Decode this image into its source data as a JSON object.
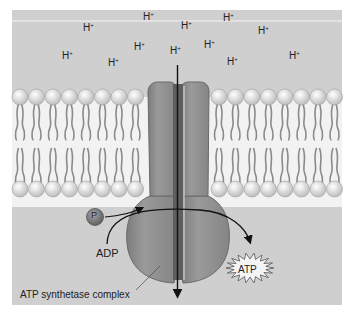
{
  "colors": {
    "panel": "#cfcfcf",
    "membrane_core": "#f2f2f2",
    "lipid_head": "#e4e4e4",
    "lipid_tail": "#8a8a8a",
    "protein": "#8c8c8c",
    "protein_dark": "#5e5e5e",
    "phosphate": "#7a7a7a",
    "arrow": "#111111"
  },
  "protons": [
    {
      "label": "H",
      "charge": "+",
      "x": 143,
      "y": 19
    },
    {
      "label": "H",
      "charge": "+",
      "x": 223,
      "y": 20
    },
    {
      "label": "H",
      "charge": "+",
      "x": 83,
      "y": 30
    },
    {
      "label": "H",
      "charge": "+",
      "x": 181,
      "y": 28
    },
    {
      "label": "H",
      "charge": "+",
      "x": 258,
      "y": 33
    },
    {
      "label": "H",
      "charge": "+",
      "x": 134,
      "y": 49
    },
    {
      "label": "H",
      "charge": "+",
      "x": 204,
      "y": 47
    },
    {
      "label": "H",
      "charge": "+",
      "x": 62,
      "y": 58
    },
    {
      "label": "H",
      "charge": "+",
      "x": 170,
      "y": 53
    },
    {
      "label": "H",
      "charge": "+",
      "x": 108,
      "y": 65
    },
    {
      "label": "H",
      "charge": "+",
      "x": 227,
      "y": 64
    },
    {
      "label": "H",
      "charge": "+",
      "x": 289,
      "y": 58
    }
  ],
  "labels": {
    "phosphate": "P",
    "adp": "ADP",
    "atp": "ATP",
    "complex": "ATP synthetase complex"
  }
}
